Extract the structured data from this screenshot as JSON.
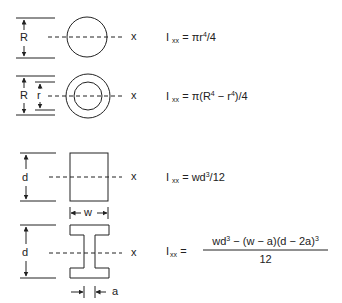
{
  "diagram": {
    "line_color": "#222222",
    "shapes": [
      {
        "name": "solid-circle",
        "dimension_labels": [
          "R"
        ],
        "axis_label": "x",
        "formula": {
          "lhs": "I",
          "lhs_sub": "xx",
          "eq": "=",
          "rhs_pre": "πr",
          "rhs_sup": "4",
          "rhs_post": "/4"
        }
      },
      {
        "name": "hollow-circle",
        "dimension_labels": [
          "R",
          "r"
        ],
        "axis_label": "x",
        "formula": {
          "lhs": "I",
          "lhs_sub": "xx",
          "eq": "=",
          "rhs_pre": "π(R",
          "rhs_sup": "4",
          "rhs_mid": " − r",
          "rhs_sup2": "4",
          "rhs_post": ")/4"
        }
      },
      {
        "name": "rectangle",
        "dimension_labels": [
          "d",
          "w"
        ],
        "axis_label": "x",
        "formula": {
          "lhs": "I",
          "lhs_sub": "xx",
          "eq": "=",
          "rhs_pre": "wd",
          "rhs_sup": "3",
          "rhs_post": "/12"
        }
      },
      {
        "name": "i-beam",
        "dimension_labels": [
          "d",
          "a"
        ],
        "axis_label": "x",
        "formula": {
          "lhs": "I",
          "lhs_sub": "xx",
          "eq": "=",
          "num_a": "wd",
          "num_a_sup": "3",
          "num_b": " − (w − a)(d − 2a)",
          "num_b_sup": "3",
          "den": "12"
        }
      }
    ]
  }
}
